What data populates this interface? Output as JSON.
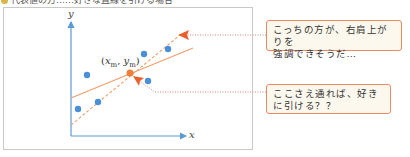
{
  "header": {
    "title": "代表値の方……好きな直線を引ける場合"
  },
  "diagram": {
    "x_axis_label": "x",
    "y_axis_label": "y",
    "mean_point_label": {
      "open": "(",
      "x": "x",
      "x_sub": "m",
      "sep": ", ",
      "y": "y",
      "y_sub": "m",
      "close": ")"
    },
    "colors": {
      "axis": "#5b9bd5",
      "points": "#4a90d9",
      "mean_point": "#f07f3c",
      "solid_line": "#f0a070",
      "dashed_line": "#f0a070",
      "arrow": "#e8612c",
      "dotted_leader": "#d98080",
      "callout_border": "#e98a62",
      "callout_bg": "#fdf8ee"
    },
    "points": [
      {
        "x": 78,
        "y": 109
      },
      {
        "x": 87,
        "y": 75
      },
      {
        "x": 98,
        "y": 102
      },
      {
        "x": 144,
        "y": 54
      },
      {
        "x": 148,
        "y": 81
      },
      {
        "x": 168,
        "y": 49
      }
    ],
    "mean_point": {
      "x": 130,
      "y": 73
    }
  },
  "callouts": [
    {
      "text_line1": "こっちの方が、右肩上がりを",
      "text_line2": "強調できそうだ…"
    },
    {
      "text_line1": "ここさえ通れば、好き",
      "text_line2": "に引ける？？"
    }
  ]
}
